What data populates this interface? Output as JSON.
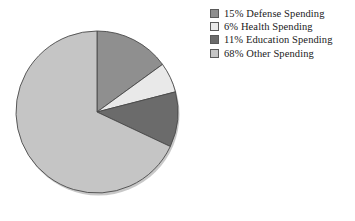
{
  "chart_data": {
    "type": "pie",
    "title": "",
    "subtitle": "",
    "xlabel": "",
    "ylabel": "",
    "grid": false,
    "legend_position": "right",
    "start_angle_deg": 0,
    "direction": "clockwise",
    "center": {
      "x": 97,
      "y": 112
    },
    "radius": 81,
    "categories": [
      "Defense Spending",
      "Health Spending",
      "Education Spending",
      "Other Spending"
    ],
    "values": [
      15,
      6,
      11,
      68
    ],
    "value_unit": "%",
    "slices": [
      {
        "label": "Defense Spending",
        "value": 15,
        "percent_text": "15%",
        "legend_text": "15% Defense Spending",
        "color": "#8f8f8f"
      },
      {
        "label": "Health Spending",
        "value": 6,
        "percent_text": "6%",
        "legend_text": "6% Health Spending",
        "color": "#e9e9e9"
      },
      {
        "label": "Education Spending",
        "value": 11,
        "percent_text": "11%",
        "legend_text": "11% Education Spending",
        "color": "#6b6b6b"
      },
      {
        "label": "Other Spending",
        "value": 68,
        "percent_text": "68%",
        "legend_text": "68% Other Spending",
        "color": "#c5c5c5"
      }
    ]
  },
  "legend": {
    "items": [
      {
        "swatch_name": "legend-swatch-defense",
        "color": "#8f8f8f",
        "text": "15% Defense Spending"
      },
      {
        "swatch_name": "legend-swatch-health",
        "color": "#e9e9e9",
        "text": "6% Health Spending"
      },
      {
        "swatch_name": "legend-swatch-education",
        "color": "#6b6b6b",
        "text": "11% Education Spending"
      },
      {
        "swatch_name": "legend-swatch-other",
        "color": "#c5c5c5",
        "text": "68% Other Spending"
      }
    ]
  },
  "style": {
    "background": "#ffffff",
    "slice_outline": "#4a4a4a",
    "text_color": "#1a1a1a"
  }
}
